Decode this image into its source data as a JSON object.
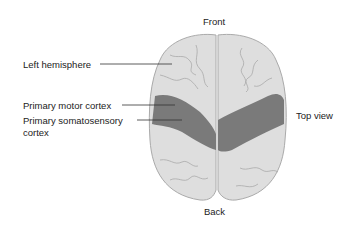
{
  "labels": {
    "front": "Front",
    "back": "Back",
    "top_view": "Top view",
    "left_hemisphere": "Left hemisphere",
    "primary_motor_cortex": "Primary motor cortex",
    "primary_somatosensory_line1": "Primary somatosensory",
    "primary_somatosensory_line2": "cortex"
  },
  "colors": {
    "brain_fill": "#dedede",
    "gyri_lines": "#a9a9a9",
    "cortex_band": "#7a7a7a",
    "leader_lines": "#333333"
  }
}
